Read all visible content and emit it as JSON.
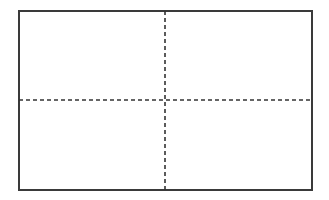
{
  "diagram": {
    "type": "quadrant-grid",
    "rows": 2,
    "columns": 2,
    "frame": {
      "x": 18,
      "y": 10,
      "width": 295,
      "height": 181,
      "stroke": "#3a3a3a",
      "stroke_width": 2
    },
    "divider_vertical": {
      "x": 165,
      "y1": 11,
      "y2": 190,
      "style": "dashed",
      "dash": [
        4,
        3
      ],
      "stroke": "#333333"
    },
    "divider_horizontal": {
      "y": 100,
      "x1": 19,
      "x2": 312,
      "style": "dashed",
      "dash": [
        4,
        3
      ],
      "stroke": "#333333"
    },
    "quadrants": [
      {
        "position": "top-left",
        "label": ""
      },
      {
        "position": "top-right",
        "label": ""
      },
      {
        "position": "bottom-left",
        "label": ""
      },
      {
        "position": "bottom-right",
        "label": ""
      }
    ],
    "background": "#ffffff"
  }
}
